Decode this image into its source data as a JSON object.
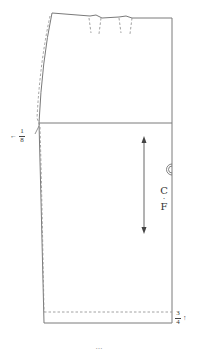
{
  "figure": {
    "type": "skirt-pattern-front",
    "colors": {
      "outline": "#7a7a7a",
      "dashed": "#8a8a8a",
      "text": "#333333",
      "background": "#ffffff"
    },
    "labels": {
      "side_seam_measure": {
        "numerator": "1",
        "denominator": "8",
        "arrow": "←"
      },
      "hem_measure": {
        "numerator": "3",
        "denominator": "4",
        "arrow": "↑"
      },
      "center_front": {
        "line1": "C",
        "dot": "·",
        "line2": "F"
      },
      "notch_symbol": "◎"
    },
    "caption": "…"
  }
}
